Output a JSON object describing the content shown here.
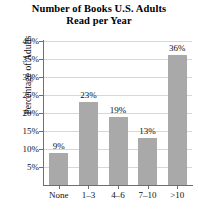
{
  "chart_data": {
    "type": "bar",
    "title": "Number of Books U.S. Adults Read per Year",
    "title_lines": [
      "Number of Books U.S. Adults",
      "Read per Year"
    ],
    "categories": [
      "None",
      "1–3",
      "4–6",
      "7–10",
      ">10"
    ],
    "values": [
      9,
      23,
      19,
      13,
      36
    ],
    "data_labels": [
      "9%",
      "23%",
      "19%",
      "13%",
      "36%"
    ],
    "xlabel": "",
    "ylabel": "Percentage of Adults",
    "ylim": [
      0,
      40
    ],
    "ytick_values": [
      40,
      35,
      30,
      25,
      20,
      15,
      10,
      5
    ],
    "ytick_labels": [
      "40%",
      "35%",
      "30%",
      "25%",
      "20%",
      "15%",
      "10%",
      "5%"
    ],
    "grid": true,
    "legend": false,
    "bar_color": "#a9a9a9",
    "axis_color": "#6e6e6e",
    "grid_color": "#d7d7d7",
    "background": "#ffffff"
  }
}
